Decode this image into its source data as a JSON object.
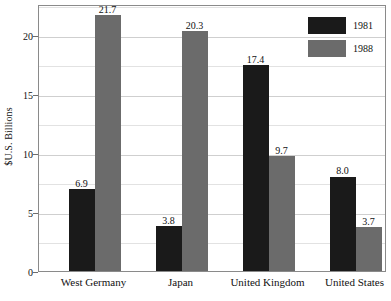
{
  "chart_data": {
    "type": "bar",
    "title": "",
    "subtitle": "",
    "xlabel": "",
    "ylabel": "$U.S. Billions",
    "categories": [
      "West Germany",
      "Japan",
      "United Kingdom",
      "United States"
    ],
    "series": [
      {
        "name": "1981",
        "color": "#1a1a1a",
        "values": [
          6.9,
          3.8,
          17.4,
          8.0
        ]
      },
      {
        "name": "1988",
        "color": "#6b6b6b",
        "values": [
          21.7,
          20.3,
          9.7,
          3.7
        ]
      }
    ],
    "value_labels": [
      [
        "6.9",
        "3.8",
        "17.4",
        "8.0"
      ],
      [
        "21.7",
        "20.3",
        "9.7",
        "3.7"
      ]
    ],
    "ylim": [
      0,
      22.6
    ],
    "yticks": [
      0,
      5,
      10,
      15,
      20
    ],
    "ytick_labels": [
      "0",
      "5",
      "10",
      "15",
      "20"
    ],
    "yminor_ticks": [
      2.5,
      7.5,
      12.5,
      17.5,
      22.5
    ],
    "grid": true,
    "grid_axis": "y",
    "legend": {
      "position": "top-right-inside",
      "entries": [
        {
          "label": "1981",
          "color": "#1a1a1a"
        },
        {
          "label": "1988",
          "color": "#6b6b6b"
        }
      ]
    },
    "background_color": "#ffffff",
    "frame_color": "#8a8a8a",
    "grid_color": "#cfcfcf"
  }
}
